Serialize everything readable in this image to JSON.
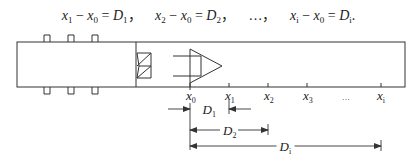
{
  "equation": {
    "terms": [
      {
        "lhs_a": "x",
        "lhs_a_sub": "1",
        "lhs_b": "x",
        "lhs_b_sub": "0",
        "rhs": "D",
        "rhs_sub": "1",
        "sep": "，"
      },
      {
        "lhs_a": "x",
        "lhs_a_sub": "2",
        "lhs_b": "x",
        "lhs_b_sub": "0",
        "rhs": "D",
        "rhs_sub": "2",
        "sep": "，"
      },
      {
        "ellipsis": "…",
        "sep": "，"
      },
      {
        "lhs_a": "x",
        "lhs_a_sub": "i",
        "lhs_b": "x",
        "lhs_b_sub": "0",
        "rhs": "D",
        "rhs_sub": "i",
        "sep": "."
      }
    ],
    "minus": "−",
    "equals": "="
  },
  "axis": {
    "ticks": [
      {
        "base": "x",
        "sub": "0"
      },
      {
        "base": "x",
        "sub": "1"
      },
      {
        "base": "x",
        "sub": "2"
      },
      {
        "base": "x",
        "sub": "3"
      },
      {
        "base": "",
        "sub": "",
        "text": "…"
      },
      {
        "base": "x",
        "sub": "i"
      }
    ]
  },
  "dimensions": [
    {
      "base": "D",
      "sub": "1",
      "from": "x0",
      "to": "x1",
      "style": "outside-arrows"
    },
    {
      "base": "D",
      "sub": "2",
      "from": "x0",
      "to": "x2",
      "style": "inside-arrows"
    },
    {
      "base": "D",
      "sub": "i",
      "from": "x0",
      "to": "xi",
      "style": "inside-arrows"
    }
  ],
  "colors": {
    "line": "#333333",
    "text": "#222222",
    "background": "#ffffff"
  }
}
